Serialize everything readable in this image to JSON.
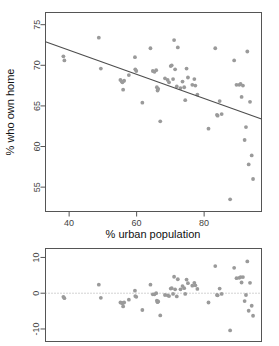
{
  "chart_data": [
    {
      "id": "scatter",
      "type": "scatter",
      "title": "",
      "xlabel": "% urban population",
      "ylabel": "% who own home",
      "xlim": [
        33,
        97
      ],
      "ylim": [
        52,
        76.5
      ],
      "xticks": [
        40,
        60,
        80
      ],
      "xticklabels": [
        "40",
        "60",
        "80"
      ],
      "yticks": [
        55,
        60,
        65,
        70,
        75
      ],
      "yticklabels": [
        "55",
        "60",
        "65",
        "70",
        "75"
      ],
      "grid": false,
      "legend": "none",
      "point_color": "#9a9a9a",
      "line_color": "#4d4d4d",
      "fit_line": {
        "label": "least-squares fit",
        "x_start": 33.0,
        "y_start": 72.9,
        "x_end": 97.0,
        "y_end": 63.4
      },
      "x": [
        38.3,
        38.6,
        48.8,
        49.4,
        55.2,
        55.6,
        55.8,
        56.0,
        56.3,
        57.7,
        59.5,
        59.6,
        59.9,
        61.7,
        64.1,
        64.8,
        65.3,
        65.8,
        66.0,
        66.2,
        66.4,
        67.0,
        68.4,
        69.2,
        69.6,
        70.1,
        70.4,
        70.8,
        71.1,
        71.4,
        71.9,
        72.2,
        73.0,
        73.6,
        74.1,
        74.4,
        74.8,
        75.2,
        76.5,
        77.1,
        77.4,
        78.0,
        81.3,
        83.3,
        83.8,
        84.0,
        84.6,
        85.2,
        87.7,
        88.9,
        89.6,
        90.4,
        90.8,
        91.1,
        91.5,
        92.0,
        92.4,
        92.8,
        93.2,
        93.6,
        94.1,
        94.5
      ],
      "y": [
        71.1,
        70.6,
        73.4,
        69.6,
        68.2,
        68.0,
        67.9,
        67.0,
        68.1,
        68.8,
        71.0,
        69.5,
        69.3,
        65.4,
        72.1,
        69.3,
        69.2,
        69.4,
        67.3,
        66.9,
        67.1,
        63.1,
        68.4,
        68.2,
        67.9,
        69.9,
        70.0,
        68.3,
        73.1,
        69.5,
        67.4,
        72.2,
        67.2,
        68.0,
        67.3,
        65.7,
        69.6,
        68.5,
        67.6,
        68.3,
        67.5,
        66.4,
        62.2,
        72.1,
        63.9,
        63.8,
        65.6,
        64.0,
        53.5,
        70.6,
        67.6,
        67.6,
        67.7,
        66.1,
        67.5,
        60.8,
        62.4,
        71.7,
        57.8,
        65.5,
        58.9,
        56.0
      ]
    },
    {
      "id": "residuals",
      "type": "scatter",
      "title": "",
      "xlabel": "",
      "ylabel": "",
      "xlim": [
        33,
        97
      ],
      "ylim": [
        -13.5,
        12.5
      ],
      "xticks": [],
      "xticklabels": [],
      "yticks": [
        -10,
        0,
        10
      ],
      "yticklabels": [
        "-10",
        "0",
        "10"
      ],
      "grid": false,
      "legend": "none",
      "point_color": "#9a9a9a",
      "zero_line": 0,
      "x": [
        38.3,
        38.6,
        48.8,
        49.4,
        55.2,
        55.6,
        55.8,
        56.0,
        56.3,
        57.7,
        59.5,
        59.6,
        59.9,
        61.7,
        64.1,
        64.8,
        65.3,
        65.8,
        66.0,
        66.2,
        66.4,
        67.0,
        68.4,
        69.2,
        69.6,
        70.1,
        70.4,
        70.8,
        71.1,
        71.4,
        71.9,
        72.2,
        73.0,
        73.6,
        74.1,
        74.4,
        74.8,
        75.2,
        76.5,
        77.1,
        77.4,
        78.0,
        81.3,
        83.3,
        83.8,
        84.0,
        84.6,
        85.2,
        87.7,
        88.9,
        89.6,
        90.4,
        90.8,
        91.1,
        91.5,
        92.0,
        92.4,
        92.8,
        93.2,
        93.6,
        94.1,
        94.5
      ],
      "y": [
        -1.0,
        -1.4,
        2.4,
        -1.3,
        -2.6,
        -2.7,
        -2.8,
        -3.7,
        -2.6,
        -1.8,
        0.7,
        -0.8,
        -1.0,
        -4.7,
        2.4,
        -0.3,
        -0.3,
        0.0,
        -2.1,
        -2.5,
        -2.3,
        -6.2,
        -0.5,
        -0.6,
        -0.8,
        1.3,
        1.4,
        -0.2,
        4.6,
        1.1,
        -0.9,
        3.9,
        1.1,
        2.0,
        1.4,
        -0.2,
        3.8,
        2.8,
        2.1,
        2.9,
        2.2,
        1.2,
        -2.6,
        7.6,
        -0.5,
        -0.6,
        1.3,
        -0.2,
        -10.4,
        7.1,
        4.2,
        4.3,
        4.5,
        3.0,
        4.5,
        -2.2,
        -0.5,
        8.9,
        -4.9,
        2.9,
        -3.5,
        -6.3
      ]
    }
  ],
  "figure": {
    "scatter_xlabel": "% urban population",
    "scatter_ylabel": "% who own home"
  }
}
